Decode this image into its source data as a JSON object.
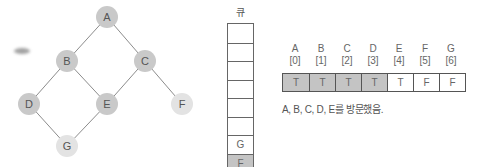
{
  "graph": {
    "nodes": [
      {
        "id": "A",
        "x": 107,
        "y": 17,
        "state": "visited"
      },
      {
        "id": "B",
        "x": 67,
        "y": 61,
        "state": "visited"
      },
      {
        "id": "C",
        "x": 145,
        "y": 61,
        "state": "visited"
      },
      {
        "id": "D",
        "x": 29,
        "y": 104,
        "state": "visited"
      },
      {
        "id": "E",
        "x": 107,
        "y": 104,
        "state": "visited"
      },
      {
        "id": "F",
        "x": 182,
        "y": 104,
        "state": "unvisited"
      },
      {
        "id": "G",
        "x": 67,
        "y": 146,
        "state": "unvisited"
      }
    ],
    "edges": [
      [
        "A",
        "B"
      ],
      [
        "A",
        "C"
      ],
      [
        "B",
        "D"
      ],
      [
        "B",
        "E"
      ],
      [
        "C",
        "E"
      ],
      [
        "C",
        "F"
      ],
      [
        "D",
        "G"
      ],
      [
        "E",
        "G"
      ]
    ]
  },
  "queue": {
    "label": "큐",
    "cells": [
      "",
      "",
      "",
      "",
      "",
      "",
      "G",
      "F"
    ]
  },
  "visited_array": {
    "labels": [
      "A",
      "B",
      "C",
      "D",
      "E",
      "F",
      "G"
    ],
    "indices": [
      "[0]",
      "[1]",
      "[2]",
      "[3]",
      "[4]",
      "[5]",
      "[6]"
    ],
    "values": [
      "T",
      "T",
      "T",
      "T",
      "T",
      "F",
      "F"
    ],
    "shaded": [
      true,
      true,
      true,
      true,
      false,
      false,
      false
    ]
  },
  "caption": "A, B, C, D, E를 방문했음.",
  "colors": {
    "visited_node": "#c9c9c9",
    "unvisited_node": "#e3e3e3",
    "edge": "#8c8c8c",
    "shaded_cell": "#c4c4c4"
  }
}
